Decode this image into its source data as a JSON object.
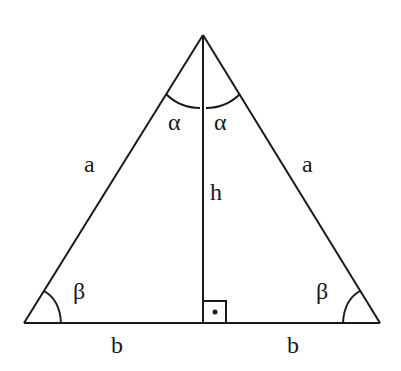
{
  "diagram": {
    "stroke_color": "#1a1a1a",
    "background": "#ffffff",
    "vertices": {
      "apex": [
        203,
        35
      ],
      "base_left": [
        24,
        323
      ],
      "base_right": [
        380,
        323
      ],
      "foot": [
        203,
        323
      ]
    },
    "labels": {
      "side_left": "a",
      "side_right": "a",
      "height": "h",
      "base_left": "b",
      "base_right": "b",
      "angle_apex_left": "α",
      "angle_apex_right": "α",
      "angle_base_left": "β",
      "angle_base_right": "β"
    },
    "right_angle_marker": "·"
  }
}
